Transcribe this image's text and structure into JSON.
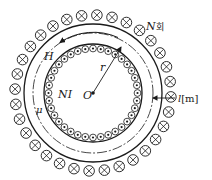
{
  "diagram": {
    "type": "toroidal-coil",
    "center": {
      "x": 93,
      "y": 93
    },
    "colors": {
      "stroke": "#1a1a1a",
      "background": "#ffffff"
    },
    "outer_coil": {
      "ring_radius": 78,
      "conductor_radius": 5.3,
      "count": 32,
      "symbol": "cross (current into page)"
    },
    "core_outer_radius": 69,
    "mean_path_radius": 60,
    "core_inner_radius": 49,
    "inner_coil": {
      "ring_radius": 44.5,
      "conductor_radius": 3.4,
      "count": 36,
      "symbol": "dot (current out of page)"
    }
  },
  "labels": {
    "turns": "N",
    "turns_suffix": "회",
    "field": "H",
    "mmf": "NI",
    "radius": "r",
    "center": "O",
    "permeability": "μ",
    "path_length": "l",
    "path_unit": "[m]"
  }
}
